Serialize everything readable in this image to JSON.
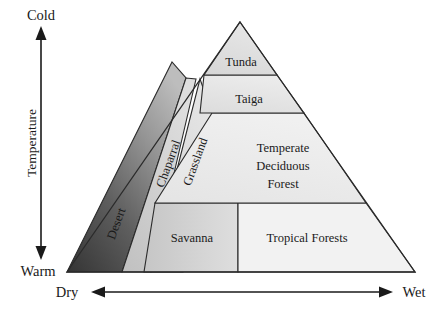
{
  "figure": {
    "type": "diagram"
  },
  "axes": {
    "vertical": {
      "name": "Temperature",
      "top_label": "Cold",
      "bottom_label": "Warm",
      "arrow": "double-headed-vertical"
    },
    "horizontal": {
      "left_label": "Dry",
      "right_label": "Wet",
      "arrow": "double-headed-horizontal"
    }
  },
  "biomes": [
    {
      "id": "tunda",
      "label": "Tunda",
      "lines": [
        "Tunda"
      ],
      "shade": "#dcdcdc"
    },
    {
      "id": "taiga",
      "label": "Taiga",
      "lines": [
        "Taiga"
      ],
      "shade": "#e2e2e2"
    },
    {
      "id": "temperate",
      "label": "Temperate Deciduous Forest",
      "lines": [
        "Temperate",
        "Deciduous",
        "Forest"
      ],
      "shade": "#ececec"
    },
    {
      "id": "desert",
      "label": "Desert",
      "lines": [
        "Desert"
      ],
      "shade": "#4a4a4a"
    },
    {
      "id": "chaparral",
      "label": "Chaparral",
      "lines": [
        "Chaparral"
      ],
      "shade": "#c9c9c9"
    },
    {
      "id": "grassland",
      "label": "Grassland",
      "lines": [
        "Grassland"
      ],
      "shade": "#d6d6d6"
    },
    {
      "id": "savanna",
      "label": "Savanna",
      "lines": [
        "Savanna"
      ],
      "shade": "#d2d2d2"
    },
    {
      "id": "tropical",
      "label": "Tropical Forests",
      "lines": [
        "Tropical Forests"
      ],
      "shade": "#f2f2f2"
    }
  ],
  "colors": {
    "outline": "#2b2b2b",
    "text": "#1a1a1a",
    "background": "#ffffff",
    "desert_dark": "#3a3a3a",
    "desert_light": "#b4b4b4"
  }
}
